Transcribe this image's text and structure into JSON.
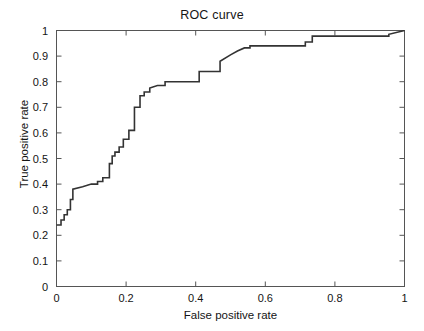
{
  "chart_data": {
    "type": "line",
    "title": "ROC curve",
    "xlabel": "False positive rate",
    "ylabel": "True positive rate",
    "xlim": [
      0,
      1
    ],
    "ylim": [
      0,
      1
    ],
    "grid": false,
    "legend": null,
    "line_color": "#333333",
    "line_width": 1.6,
    "step_style": "post",
    "x_ticks": [
      0,
      0.2,
      0.4,
      0.6,
      0.8,
      1
    ],
    "x_tick_labels": [
      "0",
      "0.2",
      "0.4",
      "0.6",
      "0.8",
      "1"
    ],
    "y_ticks": [
      0,
      0.1,
      0.2,
      0.3,
      0.4,
      0.5,
      0.6,
      0.7,
      0.8,
      0.9,
      1
    ],
    "y_tick_labels": [
      "0",
      "0.1",
      "0.2",
      "0.3",
      "0.4",
      "0.5",
      "0.6",
      "0.7",
      "0.8",
      "0.9",
      "1"
    ],
    "series": [
      {
        "name": "ROC",
        "x": [
          0.0,
          0.013,
          0.013,
          0.022,
          0.022,
          0.031,
          0.031,
          0.04,
          0.04,
          0.047,
          0.047,
          0.075,
          0.1,
          0.118,
          0.118,
          0.133,
          0.133,
          0.152,
          0.152,
          0.152,
          0.16,
          0.16,
          0.168,
          0.168,
          0.18,
          0.18,
          0.192,
          0.192,
          0.208,
          0.208,
          0.224,
          0.224,
          0.24,
          0.24,
          0.252,
          0.252,
          0.268,
          0.268,
          0.29,
          0.312,
          0.312,
          0.41,
          0.41,
          0.47,
          0.47,
          0.5,
          0.52,
          0.54,
          0.556,
          0.556,
          0.715,
          0.715,
          0.735,
          0.735,
          0.955,
          0.955,
          1.0
        ],
        "y": [
          0.24,
          0.24,
          0.26,
          0.26,
          0.28,
          0.28,
          0.3,
          0.3,
          0.34,
          0.34,
          0.38,
          0.39,
          0.4,
          0.4,
          0.41,
          0.41,
          0.425,
          0.425,
          0.44,
          0.48,
          0.48,
          0.51,
          0.51,
          0.525,
          0.525,
          0.545,
          0.545,
          0.575,
          0.575,
          0.61,
          0.61,
          0.7,
          0.7,
          0.745,
          0.745,
          0.76,
          0.76,
          0.775,
          0.785,
          0.785,
          0.8,
          0.8,
          0.84,
          0.84,
          0.88,
          0.905,
          0.92,
          0.932,
          0.932,
          0.94,
          0.94,
          0.955,
          0.955,
          0.978,
          0.978,
          0.985,
          1.0
        ]
      }
    ]
  },
  "axes": {
    "x_tick_labels": [
      "0",
      "0.2",
      "0.4",
      "0.6",
      "0.8",
      "1"
    ],
    "y_tick_labels": [
      "1",
      "0.9",
      "0.8",
      "0.7",
      "0.6",
      "0.5",
      "0.4",
      "0.3",
      "0.2",
      "0.1",
      "0"
    ]
  }
}
